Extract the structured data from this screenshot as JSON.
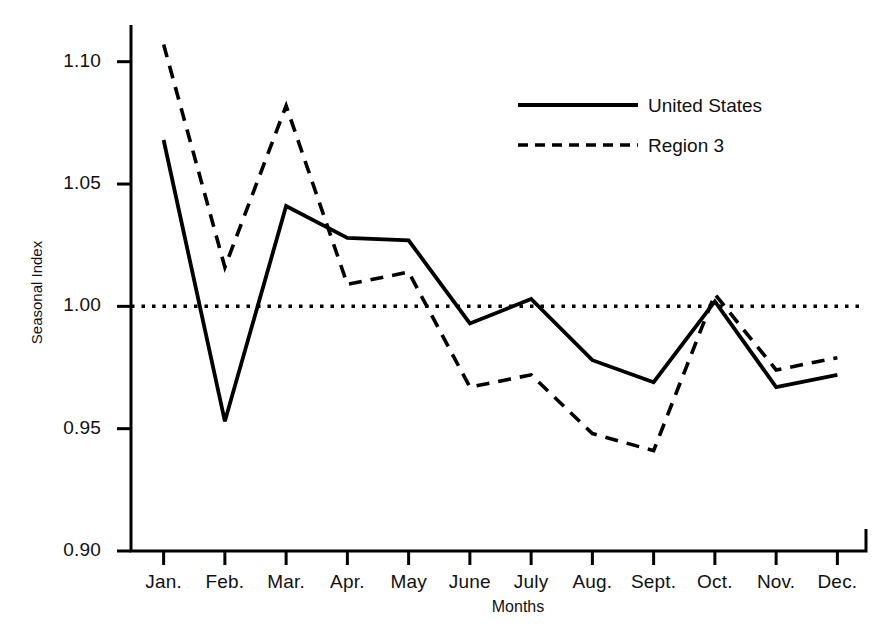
{
  "chart_data": {
    "type": "line",
    "title": "",
    "xlabel": "Months",
    "ylabel": "Seasonal Index",
    "categories": [
      "Jan.",
      "Feb.",
      "Mar.",
      "Apr.",
      "May",
      "June",
      "July",
      "Aug.",
      "Sept.",
      "Oct.",
      "Nov.",
      "Dec."
    ],
    "ylim": [
      0.9,
      1.115
    ],
    "yticks": [
      0.9,
      0.95,
      1.0,
      1.05,
      1.1
    ],
    "ytick_labels": [
      "0.90",
      "0.95",
      "1.00",
      "1.05",
      "1.10"
    ],
    "grid": false,
    "reference_line": {
      "value": 1.0,
      "style": "dotted",
      "label": ""
    },
    "legend_position": "upper right",
    "series": [
      {
        "name": "United States",
        "style": "solid",
        "color": "#000000",
        "values": [
          1.068,
          0.953,
          1.041,
          1.028,
          1.027,
          0.993,
          1.003,
          0.978,
          0.969,
          1.002,
          0.967,
          0.972
        ]
      },
      {
        "name": "Region 3",
        "style": "dashed",
        "color": "#000000",
        "values": [
          1.107,
          1.016,
          1.082,
          1.009,
          1.014,
          0.967,
          0.972,
          0.948,
          0.941,
          1.005,
          0.974,
          0.979
        ]
      }
    ]
  },
  "axes": {
    "ytick_labels": [
      "1.10",
      "1.05",
      "1.00",
      "0.95",
      "0.90"
    ],
    "xtick_labels": [
      "Jan.",
      "Feb.",
      "Mar.",
      "Apr.",
      "May",
      "June",
      "July",
      "Aug.",
      "Sept.",
      "Oct.",
      "Nov.",
      "Dec."
    ],
    "ylabel": "Seasonal Index",
    "xlabel": "Months"
  },
  "legend": {
    "items": [
      {
        "label": "United States",
        "style": "solid"
      },
      {
        "label": "Region 3",
        "style": "dashed"
      }
    ]
  }
}
